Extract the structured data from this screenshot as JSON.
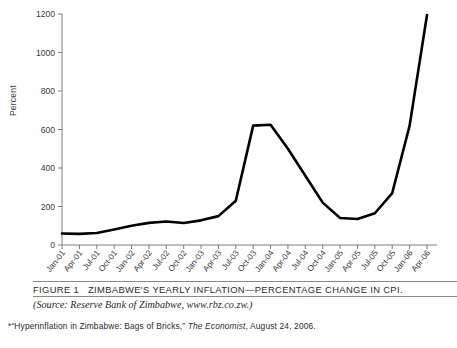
{
  "figure": {
    "number_label": "FIGURE 1",
    "title": "ZIMBABWE'S YEARLY INFLATION—PERCENTAGE CHANGE IN CPI.",
    "source_prefix": "(Source:",
    "source_body": "Reserve Bank of Zimbabwe,",
    "source_url": "www.rbz.co.zw.)",
    "footnote_marker": "*",
    "footnote_quote": "“Hyperinflation in Zimbabwe: Bags of Bricks,”",
    "footnote_publication": "The Economist",
    "footnote_date": ", August 24, 2006."
  },
  "chart_data": {
    "type": "line",
    "title": "ZIMBABWE'S YEARLY INFLATION—PERCENTAGE CHANGE IN CPI.",
    "xlabel": "",
    "ylabel": "Percent",
    "ylim": [
      0,
      1200
    ],
    "yticks": [
      0,
      200,
      400,
      600,
      800,
      1000,
      1200
    ],
    "ytick_labels": [
      "0",
      "200",
      "400",
      "600",
      "800",
      "1000",
      "1200"
    ],
    "grid": false,
    "legend": "none",
    "line_color": "#000000",
    "line_width": 2.6,
    "categories": [
      "Jan-01",
      "Apr-01",
      "Jul-01",
      "Oct-01",
      "Jan-02",
      "Apr-02",
      "Jul-02",
      "Oct-02",
      "Jan-03",
      "Apr-03",
      "Jul-03",
      "Oct-03",
      "Jan-04",
      "Apr-04",
      "Jul-04",
      "Oct-04",
      "Jan-05",
      "Apr-05",
      "Jul-05",
      "Oct-05",
      "Jan-06",
      "Apr-06"
    ],
    "values": [
      60,
      58,
      62,
      80,
      100,
      115,
      122,
      114,
      128,
      150,
      230,
      620,
      625,
      500,
      360,
      220,
      140,
      135,
      165,
      270,
      620,
      1195
    ],
    "series": [
      {
        "name": "Yearly inflation (percentage change in CPI)",
        "values": [
          60,
          58,
          62,
          80,
          100,
          115,
          122,
          114,
          128,
          150,
          230,
          620,
          625,
          500,
          360,
          220,
          140,
          135,
          165,
          270,
          620,
          1195
        ]
      }
    ],
    "annotations": [
      "Peak plateau near 620-625 around Oct-03 to Jan-04",
      "Trough near 135-140 around Apr-05",
      "Final value near 1195 at Apr-06"
    ]
  }
}
